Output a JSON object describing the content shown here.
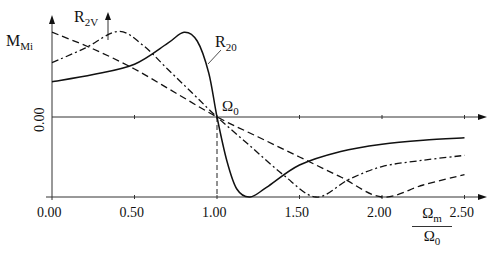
{
  "chart_data": {
    "type": "line",
    "title": "",
    "xlabel": "Ωm / Ω0",
    "ylabel": "M_Mi",
    "xlim": [
      0,
      2.6
    ],
    "ylim": [
      -1.0,
      1.25
    ],
    "grid": false,
    "x_ticks": [
      "0.00",
      "0.50",
      "1.00",
      "1.50",
      "2.00",
      "2.50"
    ],
    "y_ticks": [
      "0.00"
    ],
    "annotations": [
      "R2V",
      "R20",
      "Ω0"
    ],
    "series": [
      {
        "name": "R20",
        "style": "solid",
        "x": [
          0,
          0.25,
          0.5,
          0.7,
          0.8,
          0.88,
          0.95,
          1.0,
          1.06,
          1.12,
          1.2,
          1.3,
          1.5,
          1.75,
          2.0,
          2.25,
          2.5
        ],
        "y": [
          0.44,
          0.53,
          0.66,
          0.92,
          1.06,
          0.95,
          0.55,
          0.0,
          -0.55,
          -0.9,
          -1.0,
          -0.88,
          -0.6,
          -0.43,
          -0.34,
          -0.29,
          -0.26
        ]
      },
      {
        "name": "R2V",
        "style": "dash-dot",
        "x": [
          0,
          0.2,
          0.4,
          0.55,
          0.7,
          0.85,
          1.0,
          1.2,
          1.4,
          1.6,
          1.8,
          2.0,
          2.25,
          2.5
        ],
        "y": [
          0.68,
          0.86,
          1.07,
          0.9,
          0.6,
          0.3,
          0.0,
          -0.36,
          -0.72,
          -1.0,
          -0.78,
          -0.62,
          -0.54,
          -0.48
        ]
      },
      {
        "name": "dashed",
        "style": "dashed",
        "x": [
          0,
          0.25,
          0.5,
          0.75,
          1.0,
          1.25,
          1.5,
          1.75,
          2.0,
          2.25,
          2.5
        ],
        "y": [
          1.06,
          0.85,
          0.6,
          0.3,
          0.0,
          -0.25,
          -0.5,
          -0.75,
          -1.0,
          -0.85,
          -0.72
        ]
      }
    ]
  },
  "labels": {
    "y_axis_label": "M",
    "y_axis_label_sub": "Mi",
    "r2v_label": "R",
    "r2v_sub": "2V",
    "r20_label": "R",
    "r20_sub": "20",
    "omega0_label": "Ω",
    "omega0_sub": "0",
    "y_zero_tick": "0.00",
    "x_fraction_num": "Ω",
    "x_fraction_num_sub": "m",
    "x_fraction_den": "Ω",
    "x_fraction_den_sub": "0"
  }
}
